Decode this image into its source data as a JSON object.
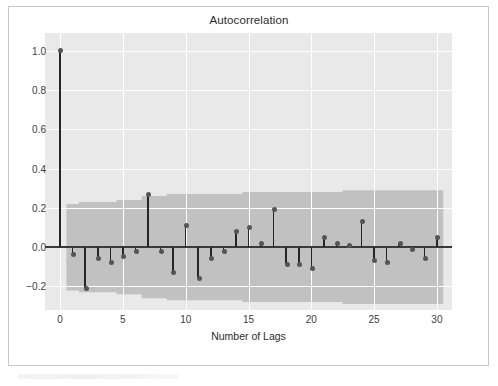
{
  "chart": {
    "title": "Autocorrelation",
    "xlabel": "Number of Lags",
    "ylabel": ""
  },
  "axis": {
    "yticks": [
      "1.0",
      "0.8",
      "0.6",
      "0.4",
      "0.2",
      "0.0",
      "-0.2"
    ],
    "ytick_values": [
      1.0,
      0.8,
      0.6,
      0.4,
      0.2,
      0.0,
      -0.2
    ],
    "xticks": [
      "0",
      "5",
      "10",
      "15",
      "20",
      "25",
      "30"
    ],
    "xtick_values": [
      0,
      5,
      10,
      15,
      20,
      25,
      30
    ]
  },
  "colors": {
    "panel_background": "#e9e9e9",
    "grid": "#ffffff",
    "band": "#bfbfbf",
    "stem": "#262626",
    "marker": "#555555",
    "zero_line": "#3a3a3a",
    "text": "#2b2b2b",
    "figure_border": "#c9c9c9"
  },
  "chart_data": {
    "type": "bar",
    "title": "Autocorrelation",
    "xlabel": "Number of Lags",
    "ylabel": "",
    "xlim": [
      -1.2,
      31.2
    ],
    "ylim": [
      -0.32,
      1.09
    ],
    "grid": true,
    "legend": null,
    "categories": [
      0,
      1,
      2,
      3,
      4,
      5,
      6,
      7,
      8,
      9,
      10,
      11,
      12,
      13,
      14,
      15,
      16,
      17,
      18,
      19,
      20,
      21,
      22,
      23,
      24,
      25,
      26,
      27,
      28,
      29,
      30
    ],
    "values": [
      1.0,
      -0.04,
      -0.21,
      -0.06,
      -0.08,
      -0.05,
      -0.02,
      0.27,
      -0.02,
      -0.13,
      0.11,
      -0.16,
      -0.06,
      -0.02,
      0.08,
      0.1,
      0.02,
      0.19,
      -0.09,
      -0.09,
      -0.11,
      0.05,
      0.02,
      0.01,
      0.13,
      -0.07,
      -0.08,
      0.02,
      -0.01,
      -0.06,
      0.05
    ],
    "confidence_band": {
      "label": "95% confidence interval",
      "upper": [
        0.22,
        0.22,
        0.23,
        0.23,
        0.23,
        0.24,
        0.24,
        0.26,
        0.26,
        0.27,
        0.27,
        0.27,
        0.27,
        0.27,
        0.27,
        0.28,
        0.28,
        0.28,
        0.28,
        0.28,
        0.28,
        0.28,
        0.28,
        0.29,
        0.29,
        0.29,
        0.29,
        0.29,
        0.29,
        0.29,
        0.29
      ],
      "lower": [
        -0.22,
        -0.22,
        -0.23,
        -0.23,
        -0.23,
        -0.24,
        -0.24,
        -0.26,
        -0.26,
        -0.27,
        -0.27,
        -0.27,
        -0.27,
        -0.27,
        -0.27,
        -0.28,
        -0.28,
        -0.28,
        -0.28,
        -0.28,
        -0.28,
        -0.28,
        -0.28,
        -0.29,
        -0.29,
        -0.29,
        -0.29,
        -0.29,
        -0.29,
        -0.29,
        -0.29
      ],
      "start_lag": 1
    }
  }
}
